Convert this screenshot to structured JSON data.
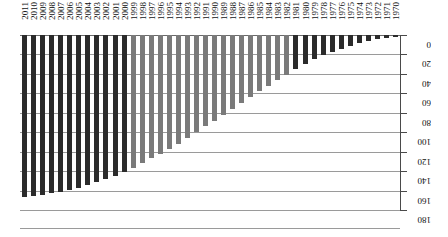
{
  "chart_data": {
    "type": "bar",
    "title": "",
    "subtitle": "",
    "xlabel": "",
    "ylabel": "",
    "orientation": "vertical-inverted",
    "grid": true,
    "legend": "none",
    "ylim": [
      0,
      180
    ],
    "y_ticks": [
      0,
      20,
      40,
      60,
      80,
      100,
      120,
      140,
      160,
      180
    ],
    "y_tick_labels": [
      "0",
      "20",
      "40",
      "60",
      "80",
      "100",
      "120",
      "140",
      "160",
      "180"
    ],
    "categories": [
      "2011",
      "2010",
      "2009",
      "2008",
      "2007",
      "2006",
      "2005",
      "2004",
      "2003",
      "2002",
      "2001",
      "2000",
      "1999",
      "1998",
      "1997",
      "1996",
      "1995",
      "1994",
      "1993",
      "1992",
      "1991",
      "1990",
      "1989",
      "1988",
      "1987",
      "1986",
      "1985",
      "1984",
      "1983",
      "1982",
      "1981",
      "1980",
      "1979",
      "1978",
      "1977",
      "1976",
      "1975",
      "1974",
      "1973",
      "1972",
      "1971",
      "1970"
    ],
    "values": [
      167,
      166,
      165,
      163,
      161,
      159,
      157,
      154,
      151,
      148,
      145,
      141,
      137,
      132,
      127,
      122,
      117,
      112,
      106,
      100,
      94,
      88,
      82,
      76,
      70,
      64,
      58,
      52,
      46,
      41,
      35,
      30,
      25,
      21,
      17,
      14,
      11,
      8,
      6,
      4,
      3,
      2
    ],
    "bar_colors": [
      "#2b2b2b",
      "#2b2b2b",
      "#2b2b2b",
      "#2b2b2b",
      "#2b2b2b",
      "#2b2b2b",
      "#2b2b2b",
      "#2b2b2b",
      "#2b2b2b",
      "#2b2b2b",
      "#2b2b2b",
      "#2b2b2b",
      "#7a7a7a",
      "#7a7a7a",
      "#7a7a7a",
      "#7a7a7a",
      "#7a7a7a",
      "#7a7a7a",
      "#7a7a7a",
      "#7a7a7a",
      "#7a7a7a",
      "#7a7a7a",
      "#7a7a7a",
      "#7a7a7a",
      "#7a7a7a",
      "#7a7a7a",
      "#7a7a7a",
      "#7a7a7a",
      "#7a7a7a",
      "#7a7a7a",
      "#2b2b2b",
      "#2b2b2b",
      "#2b2b2b",
      "#2b2b2b",
      "#2b2b2b",
      "#2b2b2b",
      "#2b2b2b",
      "#2b2b2b",
      "#2b2b2b",
      "#2b2b2b",
      "#2b2b2b",
      "#2b2b2b"
    ],
    "colors": {
      "dark_series": "#2b2b2b",
      "light_series": "#7a7a7a",
      "gridline": "#9a9a9a",
      "axis": "#4a4a4a",
      "background": "#ffffff",
      "text": "#111111"
    }
  }
}
